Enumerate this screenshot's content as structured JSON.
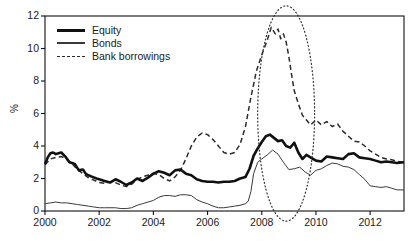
{
  "chart_data": {
    "type": "line",
    "title": "",
    "subtitle": "",
    "xlabel": "",
    "ylabel": "%",
    "xlim": [
      2000,
      2013.25
    ],
    "ylim": [
      0,
      12
    ],
    "grid": false,
    "legend_position": "top-left",
    "xticks": [
      "2000",
      "2002",
      "2004",
      "2006",
      "2008",
      "2010",
      "2012"
    ],
    "xtick_values": [
      2000,
      2002,
      2004,
      2006,
      2008,
      2010,
      2012
    ],
    "yticks": [
      "0",
      "2",
      "4",
      "6",
      "8",
      "10",
      "12"
    ],
    "ytick_values": [
      0,
      2,
      4,
      6,
      8,
      10,
      12
    ],
    "annotations": [
      {
        "name": "crisis-highlight-ellipse",
        "shape": "ellipse",
        "style": "dotted",
        "x_center": 2008.9,
        "x_span": [
          2007.85,
          2009.95
        ],
        "y_center": 6.0,
        "y_span": [
          -0.85,
          12.4
        ]
      }
    ],
    "series": [
      {
        "name": "Equity",
        "style": "solid-thick",
        "color": "#111111",
        "x": [
          2000.0,
          2000.1,
          2000.2,
          2000.3,
          2000.4,
          2000.5,
          2000.6,
          2000.75,
          2000.9,
          2001.0,
          2001.1,
          2001.25,
          2001.4,
          2001.5,
          2001.6,
          2001.75,
          2001.9,
          2002.0,
          2002.2,
          2002.4,
          2002.6,
          2002.8,
          2003.0,
          2003.2,
          2003.4,
          2003.6,
          2003.8,
          2004.0,
          2004.2,
          2004.4,
          2004.6,
          2004.8,
          2005.0,
          2005.2,
          2005.4,
          2005.6,
          2005.8,
          2006.0,
          2006.2,
          2006.4,
          2006.6,
          2006.8,
          2007.0,
          2007.2,
          2007.4,
          2007.55,
          2007.7,
          2007.85,
          2008.0,
          2008.15,
          2008.3,
          2008.45,
          2008.6,
          2008.75,
          2008.9,
          2009.05,
          2009.2,
          2009.35,
          2009.5,
          2009.65,
          2009.8,
          2010.0,
          2010.2,
          2010.4,
          2010.6,
          2010.8,
          2011.0,
          2011.2,
          2011.4,
          2011.6,
          2011.8,
          2012.0,
          2012.2,
          2012.4,
          2012.6,
          2012.8,
          2013.0,
          2013.25
        ],
        "y": [
          2.9,
          3.3,
          3.55,
          3.6,
          3.5,
          3.55,
          3.6,
          3.35,
          3.0,
          2.95,
          2.9,
          2.5,
          2.55,
          2.3,
          2.2,
          2.1,
          2.0,
          1.95,
          1.85,
          1.75,
          1.95,
          1.8,
          1.6,
          1.75,
          2.0,
          1.85,
          2.05,
          2.3,
          2.45,
          2.35,
          2.2,
          2.5,
          2.55,
          2.3,
          2.2,
          1.95,
          1.85,
          1.8,
          1.8,
          1.75,
          1.8,
          1.8,
          1.85,
          2.0,
          2.1,
          2.6,
          3.4,
          3.85,
          4.25,
          4.6,
          4.7,
          4.5,
          4.3,
          4.35,
          4.0,
          3.9,
          4.2,
          3.6,
          3.2,
          3.45,
          3.3,
          3.1,
          3.05,
          3.35,
          3.3,
          3.25,
          3.2,
          3.5,
          3.55,
          3.3,
          3.25,
          3.2,
          3.1,
          3.0,
          3.05,
          3.0,
          2.95,
          3.0
        ]
      },
      {
        "name": "Bonds",
        "style": "solid-thin",
        "color": "#3a3a3a",
        "x": [
          2000.0,
          2000.2,
          2000.4,
          2000.6,
          2000.8,
          2001.0,
          2001.2,
          2001.4,
          2001.6,
          2001.8,
          2002.0,
          2002.2,
          2002.4,
          2002.6,
          2002.8,
          2003.0,
          2003.2,
          2003.4,
          2003.6,
          2003.8,
          2004.0,
          2004.2,
          2004.4,
          2004.6,
          2004.8,
          2005.0,
          2005.2,
          2005.4,
          2005.6,
          2005.8,
          2006.0,
          2006.2,
          2006.4,
          2006.6,
          2006.8,
          2007.0,
          2007.2,
          2007.4,
          2007.5,
          2007.6,
          2007.7,
          2007.85,
          2008.0,
          2008.2,
          2008.4,
          2008.6,
          2008.8,
          2009.0,
          2009.2,
          2009.4,
          2009.6,
          2009.8,
          2010.0,
          2010.2,
          2010.4,
          2010.6,
          2010.8,
          2011.0,
          2011.2,
          2011.4,
          2011.6,
          2011.8,
          2012.0,
          2012.2,
          2012.4,
          2012.6,
          2012.8,
          2013.0,
          2013.25
        ],
        "y": [
          0.45,
          0.5,
          0.55,
          0.5,
          0.5,
          0.45,
          0.4,
          0.35,
          0.3,
          0.25,
          0.2,
          0.2,
          0.2,
          0.2,
          0.15,
          0.15,
          0.2,
          0.35,
          0.45,
          0.55,
          0.65,
          0.85,
          0.95,
          0.95,
          0.9,
          1.0,
          1.0,
          0.95,
          0.7,
          0.55,
          0.45,
          0.3,
          0.2,
          0.2,
          0.25,
          0.3,
          0.35,
          0.45,
          0.6,
          1.2,
          2.3,
          3.0,
          3.2,
          3.45,
          3.75,
          3.5,
          3.0,
          2.55,
          2.6,
          2.7,
          2.4,
          2.2,
          2.5,
          2.6,
          2.8,
          2.95,
          2.9,
          2.75,
          2.7,
          2.55,
          2.25,
          1.95,
          1.55,
          1.5,
          1.45,
          1.5,
          1.4,
          1.3,
          1.3
        ]
      },
      {
        "name": "Bank borrowings",
        "style": "dashed",
        "color": "#2b2b2b",
        "x": [
          2000.0,
          2000.2,
          2000.4,
          2000.6,
          2000.8,
          2001.0,
          2001.2,
          2001.4,
          2001.6,
          2001.8,
          2002.0,
          2002.2,
          2002.4,
          2002.6,
          2002.8,
          2003.0,
          2003.2,
          2003.4,
          2003.6,
          2003.8,
          2004.0,
          2004.2,
          2004.4,
          2004.6,
          2004.8,
          2005.0,
          2005.2,
          2005.4,
          2005.6,
          2005.8,
          2006.0,
          2006.2,
          2006.4,
          2006.6,
          2006.8,
          2007.0,
          2007.2,
          2007.4,
          2007.6,
          2007.8,
          2008.0,
          2008.2,
          2008.35,
          2008.5,
          2008.6,
          2008.7,
          2008.8,
          2008.9,
          2009.0,
          2009.1,
          2009.2,
          2009.35,
          2009.5,
          2009.65,
          2009.8,
          2010.0,
          2010.2,
          2010.4,
          2010.6,
          2010.8,
          2011.0,
          2011.2,
          2011.4,
          2011.6,
          2011.8,
          2012.0,
          2012.2,
          2012.4,
          2012.6,
          2012.8,
          2013.0,
          2013.25
        ],
        "y": [
          2.85,
          3.2,
          3.3,
          3.35,
          3.2,
          2.9,
          2.55,
          2.3,
          2.05,
          1.9,
          1.75,
          1.7,
          1.8,
          1.75,
          1.6,
          1.5,
          1.65,
          1.95,
          2.1,
          2.2,
          2.3,
          2.25,
          2.0,
          1.85,
          2.1,
          2.5,
          3.2,
          4.0,
          4.55,
          4.8,
          4.7,
          4.4,
          4.0,
          3.6,
          3.5,
          3.6,
          4.1,
          5.2,
          7.0,
          8.6,
          9.6,
          10.5,
          11.3,
          10.9,
          11.2,
          10.6,
          10.9,
          10.4,
          9.5,
          8.4,
          7.4,
          6.6,
          5.9,
          5.6,
          5.3,
          5.6,
          5.3,
          5.5,
          5.2,
          5.35,
          4.9,
          4.6,
          4.3,
          4.25,
          4.0,
          3.7,
          3.5,
          3.3,
          3.2,
          3.15,
          3.05,
          3.0
        ]
      }
    ]
  },
  "legend": {
    "items": [
      {
        "label": "Equity"
      },
      {
        "label": "Bonds"
      },
      {
        "label": "Bank borrowings"
      }
    ]
  }
}
